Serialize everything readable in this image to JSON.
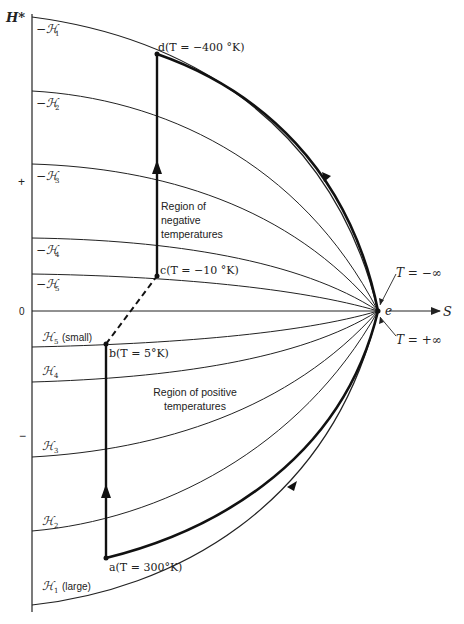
{
  "diagram": {
    "type": "thermodynamic-path-diagram",
    "axes": {
      "y_label": "H*",
      "x_label": "S",
      "y_ticks": [
        "+",
        "0",
        "−"
      ]
    },
    "negative_field_curves": [
      {
        "label": "−ℋ",
        "sub": "1"
      },
      {
        "label": "−ℋ",
        "sub": "2"
      },
      {
        "label": "−ℋ",
        "sub": "3"
      },
      {
        "label": "−ℋ",
        "sub": "4"
      },
      {
        "label": "−ℋ",
        "sub": "5"
      }
    ],
    "positive_field_curves": [
      {
        "label": "ℋ",
        "sub": "5",
        "note": "(small)"
      },
      {
        "label": "ℋ",
        "sub": "4",
        "note": ""
      },
      {
        "label": "ℋ",
        "sub": "3",
        "note": ""
      },
      {
        "label": "ℋ",
        "sub": "2",
        "note": ""
      },
      {
        "label": "ℋ",
        "sub": "1",
        "note": "(large)"
      }
    ],
    "points": {
      "a": "a(T = 300°K)",
      "b": "b(T = 5°K)",
      "c": "c(T = −10 °K)",
      "d": "d(T = −400 °K)",
      "e": "e"
    },
    "limits": {
      "upper": "T = −∞",
      "lower": "T = +∞"
    },
    "regions": {
      "negative": [
        "Region of",
        "negative",
        "temperatures"
      ],
      "positive": [
        "Region of positive",
        "temperatures"
      ]
    },
    "colors": {
      "ink": "#222222",
      "background": "#ffffff"
    }
  }
}
